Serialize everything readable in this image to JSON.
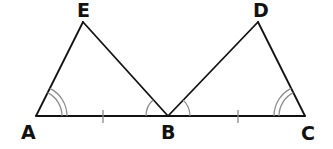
{
  "diagram": {
    "title": "",
    "points": {
      "A": {
        "label": "A",
        "x": 36,
        "y": 116
      },
      "B": {
        "label": "B",
        "x": 168,
        "y": 116
      },
      "C": {
        "label": "C",
        "x": 305,
        "y": 116
      },
      "D": {
        "label": "D",
        "x": 258,
        "y": 22
      },
      "E": {
        "label": "E",
        "x": 83,
        "y": 22
      }
    },
    "segments": [
      "AE",
      "EB",
      "AB",
      "BD",
      "DC",
      "BC"
    ],
    "triangles": [
      "AEB",
      "BDC"
    ],
    "equal_sides": [
      [
        "AB",
        "BC"
      ]
    ],
    "equal_angles": [
      {
        "angles": [
          "EAB",
          "DCB"
        ],
        "marks": 2
      },
      {
        "angles": [
          "EBA",
          "DBC"
        ],
        "marks": 1
      }
    ],
    "colors": {
      "lines": "#111111",
      "marks": "#8a8a8a",
      "background": "#ffffff"
    }
  }
}
